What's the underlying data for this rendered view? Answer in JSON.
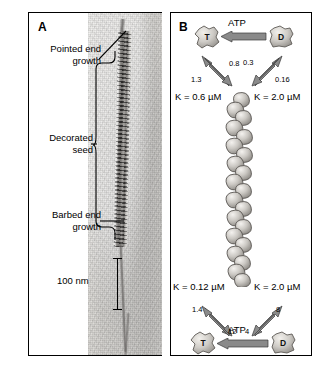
{
  "figure": {
    "panel_a": {
      "letter": "A",
      "annotations": [
        {
          "id": "pointed",
          "line1": "Pointed end",
          "line2": "growth"
        },
        {
          "id": "seed",
          "line1": "Decorated",
          "line2": "seed"
        },
        {
          "id": "barbed",
          "line1": "Barbed end",
          "line2": "growth"
        }
      ],
      "scale_bar": "100 nm"
    },
    "panel_b": {
      "letter": "B",
      "top": {
        "monomer_left": "T",
        "monomer_right": "D",
        "atp_label": "ATP",
        "rates": {
          "left_off": "1.3",
          "left_on": "0.8",
          "right_off": "0.3",
          "right_on": "0.16"
        },
        "k_left": "K = 0.6 µM",
        "k_right": "K = 2.0 µM"
      },
      "bottom": {
        "monomer_left": "T",
        "monomer_right": "D",
        "atp_label": "ATP",
        "rates": {
          "left_on": "1.4",
          "left_off": "12",
          "right_off": "8",
          "right_on": "4"
        },
        "k_left": "K = 0.12 µM",
        "k_right": "K = 2.0 µM"
      }
    }
  },
  "colors": {
    "frame": "#000000",
    "arrow_fill": "#8a8a8a",
    "arrow_stroke": "#3a3a3a",
    "subunit_light": "#e3e1dd",
    "subunit_mid": "#b8b5b0",
    "subunit_dark": "#8d8a85",
    "micrograph_bg": "#d3d1cd"
  }
}
